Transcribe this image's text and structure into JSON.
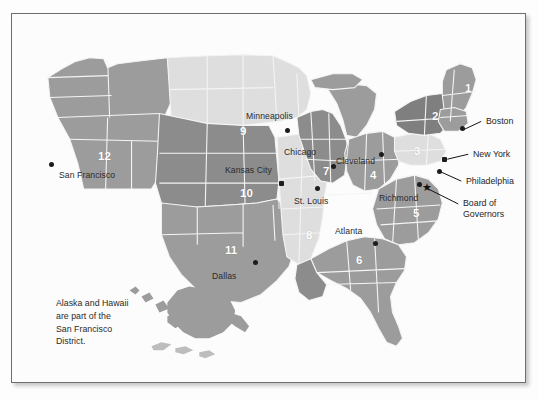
{
  "figure": {
    "note": "Alaska and Hawaii\nare part of the\nSan Francisco\nDistrict."
  },
  "colors": {
    "background": "#fcfcfc",
    "frame_border": "#6e6e6e",
    "district_light": "#dcdcdc",
    "district_medium": "#9a9a9a",
    "district_dark": "#8a8a8a",
    "state_outline": "#f2f2f2",
    "marker": "#1c1c1c",
    "label_text": "#2b2b2b",
    "number_text": "#ffffff"
  },
  "districts": [
    {
      "number": "1",
      "city": "Boston",
      "x": 455,
      "y": 75,
      "tone": "medium"
    },
    {
      "number": "2",
      "city": "New York",
      "x": 422,
      "y": 103,
      "tone": "dark"
    },
    {
      "number": "3",
      "city": "Philadelphia",
      "x": 404,
      "y": 138,
      "tone": "light"
    },
    {
      "number": "4",
      "city": "Cleveland",
      "x": 360,
      "y": 162,
      "tone": "medium"
    },
    {
      "number": "5",
      "city": "Richmond",
      "x": 403,
      "y": 200,
      "tone": "medium"
    },
    {
      "number": "6",
      "city": "Atlanta",
      "x": 346,
      "y": 247,
      "tone": "medium"
    },
    {
      "number": "7",
      "city": "Chicago",
      "x": 313,
      "y": 158,
      "tone": "dark"
    },
    {
      "number": "8",
      "city": "St. Louis",
      "x": 296,
      "y": 222,
      "tone": "light"
    },
    {
      "number": "9",
      "city": "Minneapolis",
      "x": 230,
      "y": 118,
      "tone": "light"
    },
    {
      "number": "10",
      "city": "Kansas City",
      "x": 232,
      "y": 180,
      "tone": "dark"
    },
    {
      "number": "11",
      "city": "Dallas",
      "x": 216,
      "y": 237,
      "tone": "medium"
    },
    {
      "number": "12",
      "city": "San Francisco",
      "x": 92,
      "y": 143,
      "tone": "medium"
    }
  ],
  "city_labels": [
    {
      "name": "Minneapolis",
      "x": 245,
      "y": 105,
      "dot_x": 277,
      "dot_y": 119
    },
    {
      "name": "Chicago",
      "x": 281,
      "y": 140,
      "dot_x": 323,
      "dot_y": 155
    },
    {
      "name": "Cleveland",
      "x": 332,
      "y": 149,
      "dot_x": 371,
      "dot_y": 144
    },
    {
      "name": "Kansas City",
      "x": 223,
      "y": 158,
      "dot_x": 271,
      "dot_y": 172
    },
    {
      "name": "St. Louis",
      "x": 290,
      "y": 189,
      "dot_x": 307,
      "dot_y": 177
    },
    {
      "name": "Richmond",
      "x": 375,
      "y": 186,
      "dot_x": 409,
      "dot_y": 173
    },
    {
      "name": "Atlanta",
      "x": 331,
      "y": 219,
      "dot_x": 365,
      "dot_y": 232
    },
    {
      "name": "Dallas",
      "x": 208,
      "y": 264,
      "dot_x": 245,
      "dot_y": 251
    },
    {
      "name": "San Francisco",
      "x": 55,
      "y": 163,
      "dot_x": 47,
      "dot_y": 155
    }
  ],
  "callouts": [
    {
      "label": "Boston",
      "x": 477,
      "y": 106,
      "dot_x": 452,
      "dot_y": 117,
      "line": [
        471,
        110,
        455,
        118
      ]
    },
    {
      "label": "New York",
      "x": 462,
      "y": 139,
      "dot_x": 434,
      "dot_y": 148,
      "line": [
        458,
        143,
        438,
        149
      ]
    },
    {
      "label": "Philadelphia",
      "x": 455,
      "y": 166,
      "dot_x": 429,
      "dot_y": 160,
      "line": [
        452,
        170,
        432,
        162
      ]
    },
    {
      "label": "Board of\nGovernors",
      "x": 452,
      "y": 188,
      "star_x": 415,
      "star_y": 174,
      "line": [
        449,
        193,
        420,
        178
      ]
    }
  ],
  "note_position": {
    "x": 55,
    "y": 295
  }
}
